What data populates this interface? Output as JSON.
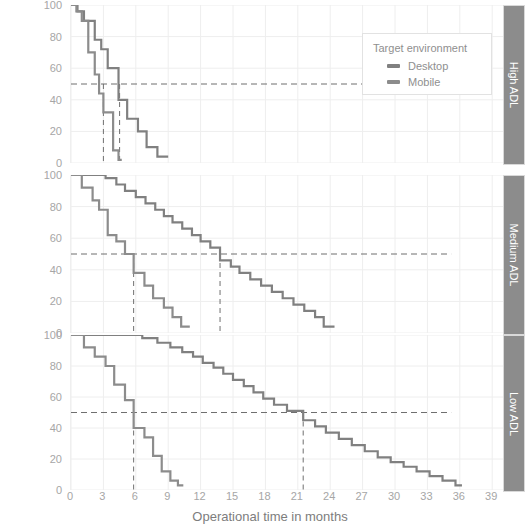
{
  "chart_data": {
    "type": "line",
    "subtype": "kaplan-meier-step",
    "title": "",
    "xlabel": "Operational time in months",
    "ylabel": "Survival probability (%)",
    "xlim": [
      0,
      40
    ],
    "ylim": [
      0,
      100
    ],
    "xticks": [
      0,
      3,
      6,
      9,
      12,
      15,
      18,
      21,
      24,
      27,
      30,
      33,
      36,
      39
    ],
    "yticks": [
      0,
      20,
      40,
      60,
      80,
      100
    ],
    "grid": true,
    "legend": {
      "position": "top-right",
      "title": "Target environment",
      "entries": [
        {
          "name": "Desktop",
          "color": "#808080"
        },
        {
          "name": "Mobile",
          "color": "#808080"
        }
      ]
    },
    "median_reference_value": 50,
    "panels": [
      {
        "label": "High ADL",
        "medians": {
          "Desktop": 4.5,
          "Mobile": 3.0
        },
        "series": [
          {
            "name": "Desktop",
            "color": "#808080",
            "points": [
              [
                0,
                100
              ],
              [
                0.6,
                100
              ],
              [
                0.6,
                96
              ],
              [
                1.2,
                96
              ],
              [
                1.2,
                90
              ],
              [
                2.2,
                90
              ],
              [
                2.2,
                78
              ],
              [
                2.8,
                78
              ],
              [
                2.8,
                72
              ],
              [
                3.4,
                72
              ],
              [
                3.4,
                60
              ],
              [
                4.4,
                60
              ],
              [
                4.4,
                40
              ],
              [
                5.2,
                40
              ],
              [
                5.2,
                28
              ],
              [
                6.2,
                28
              ],
              [
                6.2,
                20
              ],
              [
                7.0,
                20
              ],
              [
                7.0,
                10
              ],
              [
                8.0,
                10
              ],
              [
                8.0,
                4
              ],
              [
                9.0,
                4
              ]
            ]
          },
          {
            "name": "Mobile",
            "color": "#8c8c8c",
            "points": [
              [
                0,
                100
              ],
              [
                0.5,
                100
              ],
              [
                0.5,
                96
              ],
              [
                1.0,
                96
              ],
              [
                1.0,
                90
              ],
              [
                1.6,
                90
              ],
              [
                1.6,
                70
              ],
              [
                2.2,
                70
              ],
              [
                2.2,
                56
              ],
              [
                2.6,
                56
              ],
              [
                2.6,
                44
              ],
              [
                3.0,
                44
              ],
              [
                3.0,
                32
              ],
              [
                3.9,
                32
              ],
              [
                3.9,
                8
              ],
              [
                4.4,
                8
              ],
              [
                4.4,
                2
              ],
              [
                4.7,
                2
              ]
            ]
          }
        ]
      },
      {
        "label": "Medium ADL",
        "medians": {
          "Desktop": 13.8,
          "Mobile": 5.8
        },
        "series": [
          {
            "name": "Desktop",
            "color": "#808080",
            "points": [
              [
                0,
                100
              ],
              [
                3.2,
                100
              ],
              [
                3.2,
                98
              ],
              [
                4.2,
                98
              ],
              [
                4.2,
                94
              ],
              [
                5.0,
                94
              ],
              [
                5.0,
                90
              ],
              [
                6.0,
                90
              ],
              [
                6.0,
                86
              ],
              [
                6.9,
                86
              ],
              [
                6.9,
                82
              ],
              [
                7.8,
                82
              ],
              [
                7.8,
                78
              ],
              [
                8.6,
                78
              ],
              [
                8.6,
                74
              ],
              [
                9.4,
                74
              ],
              [
                9.4,
                70
              ],
              [
                10.3,
                70
              ],
              [
                10.3,
                66
              ],
              [
                11.2,
                66
              ],
              [
                11.2,
                62
              ],
              [
                12.0,
                62
              ],
              [
                12.0,
                58
              ],
              [
                12.9,
                58
              ],
              [
                12.9,
                54
              ],
              [
                13.8,
                54
              ],
              [
                13.8,
                46
              ],
              [
                14.8,
                46
              ],
              [
                14.8,
                42
              ],
              [
                15.6,
                42
              ],
              [
                15.6,
                38
              ],
              [
                16.6,
                38
              ],
              [
                16.6,
                34
              ],
              [
                17.6,
                34
              ],
              [
                17.6,
                30
              ],
              [
                18.6,
                30
              ],
              [
                18.6,
                26
              ],
              [
                19.6,
                26
              ],
              [
                19.6,
                22
              ],
              [
                20.6,
                22
              ],
              [
                20.6,
                18
              ],
              [
                21.6,
                18
              ],
              [
                21.6,
                14
              ],
              [
                22.6,
                14
              ],
              [
                22.6,
                10
              ],
              [
                23.4,
                10
              ],
              [
                23.4,
                4
              ],
              [
                24.4,
                4
              ]
            ]
          },
          {
            "name": "Mobile",
            "color": "#8c8c8c",
            "points": [
              [
                0,
                100
              ],
              [
                1.0,
                100
              ],
              [
                1.0,
                92
              ],
              [
                2.0,
                92
              ],
              [
                2.0,
                84
              ],
              [
                2.6,
                84
              ],
              [
                2.6,
                78
              ],
              [
                3.4,
                78
              ],
              [
                3.4,
                62
              ],
              [
                4.2,
                62
              ],
              [
                4.2,
                58
              ],
              [
                5.0,
                58
              ],
              [
                5.0,
                50
              ],
              [
                5.8,
                50
              ],
              [
                5.8,
                38
              ],
              [
                6.8,
                38
              ],
              [
                6.8,
                30
              ],
              [
                7.6,
                30
              ],
              [
                7.6,
                22
              ],
              [
                8.6,
                22
              ],
              [
                8.6,
                16
              ],
              [
                9.4,
                16
              ],
              [
                9.4,
                10
              ],
              [
                10.2,
                10
              ],
              [
                10.2,
                4
              ],
              [
                11.0,
                4
              ]
            ]
          }
        ]
      },
      {
        "label": "Low ADL",
        "medians": {
          "Desktop": 21.5,
          "Mobile": 5.8
        },
        "series": [
          {
            "name": "Desktop",
            "color": "#808080",
            "points": [
              [
                0,
                100
              ],
              [
                6.6,
                100
              ],
              [
                6.6,
                98
              ],
              [
                8.0,
                98
              ],
              [
                8.0,
                95
              ],
              [
                9.2,
                95
              ],
              [
                9.2,
                92
              ],
              [
                10.3,
                92
              ],
              [
                10.3,
                89
              ],
              [
                11.3,
                89
              ],
              [
                11.3,
                86
              ],
              [
                12.2,
                86
              ],
              [
                12.2,
                82
              ],
              [
                13.2,
                82
              ],
              [
                13.2,
                79
              ],
              [
                14.1,
                79
              ],
              [
                14.1,
                75
              ],
              [
                15.0,
                75
              ],
              [
                15.0,
                71
              ],
              [
                16.0,
                71
              ],
              [
                16.0,
                67
              ],
              [
                16.9,
                67
              ],
              [
                16.9,
                63
              ],
              [
                17.8,
                63
              ],
              [
                17.8,
                59
              ],
              [
                18.8,
                59
              ],
              [
                18.8,
                55
              ],
              [
                20.0,
                55
              ],
              [
                20.0,
                51
              ],
              [
                21.5,
                51
              ],
              [
                21.5,
                45
              ],
              [
                22.6,
                45
              ],
              [
                22.6,
                41
              ],
              [
                23.6,
                41
              ],
              [
                23.6,
                37
              ],
              [
                24.8,
                37
              ],
              [
                24.8,
                33
              ],
              [
                26.0,
                33
              ],
              [
                26.0,
                29
              ],
              [
                27.2,
                29
              ],
              [
                27.2,
                25
              ],
              [
                28.4,
                25
              ],
              [
                28.4,
                21
              ],
              [
                29.6,
                21
              ],
              [
                29.6,
                18
              ],
              [
                30.8,
                18
              ],
              [
                30.8,
                15
              ],
              [
                32.0,
                15
              ],
              [
                32.0,
                12
              ],
              [
                33.2,
                12
              ],
              [
                33.2,
                9
              ],
              [
                34.4,
                9
              ],
              [
                34.4,
                6
              ],
              [
                35.6,
                6
              ],
              [
                35.6,
                3
              ],
              [
                36.2,
                3
              ]
            ]
          },
          {
            "name": "Mobile",
            "color": "#8c8c8c",
            "points": [
              [
                0,
                100
              ],
              [
                1.2,
                100
              ],
              [
                1.2,
                92
              ],
              [
                2.2,
                92
              ],
              [
                2.2,
                86
              ],
              [
                3.2,
                86
              ],
              [
                3.2,
                80
              ],
              [
                4.0,
                80
              ],
              [
                4.0,
                68
              ],
              [
                5.0,
                68
              ],
              [
                5.0,
                58
              ],
              [
                5.8,
                58
              ],
              [
                5.8,
                40
              ],
              [
                6.8,
                40
              ],
              [
                6.8,
                34
              ],
              [
                7.6,
                34
              ],
              [
                7.6,
                22
              ],
              [
                8.4,
                22
              ],
              [
                8.4,
                12
              ],
              [
                9.2,
                12
              ],
              [
                9.2,
                6
              ],
              [
                9.9,
                6
              ],
              [
                9.9,
                3
              ],
              [
                10.4,
                3
              ]
            ]
          }
        ]
      }
    ]
  },
  "axis": {
    "xlabel": "Operational time in months",
    "ylabel": "Survival probability (%)",
    "xticks": [
      "0",
      "3",
      "6",
      "9",
      "12",
      "15",
      "18",
      "21",
      "24",
      "27",
      "30",
      "33",
      "36",
      "39"
    ],
    "yticks": [
      "100",
      "80",
      "60",
      "40",
      "20",
      "0"
    ]
  },
  "legend": {
    "title": "Target environment",
    "items": [
      {
        "label": "Desktop",
        "color": "#808080"
      },
      {
        "label": "Mobile",
        "color": "#8c8c8c"
      }
    ]
  },
  "strips": [
    {
      "label": "High ADL"
    },
    {
      "label": "Medium ADL"
    },
    {
      "label": "Low ADL"
    }
  ],
  "colors": {
    "grid": "#eeeeee",
    "axis_text": "#a6a6a6",
    "label_text": "#7d7d7d",
    "strip_bg": "#8c8c8c",
    "strip_text": "#ffffff",
    "median_dash": "#6f6f6f"
  }
}
